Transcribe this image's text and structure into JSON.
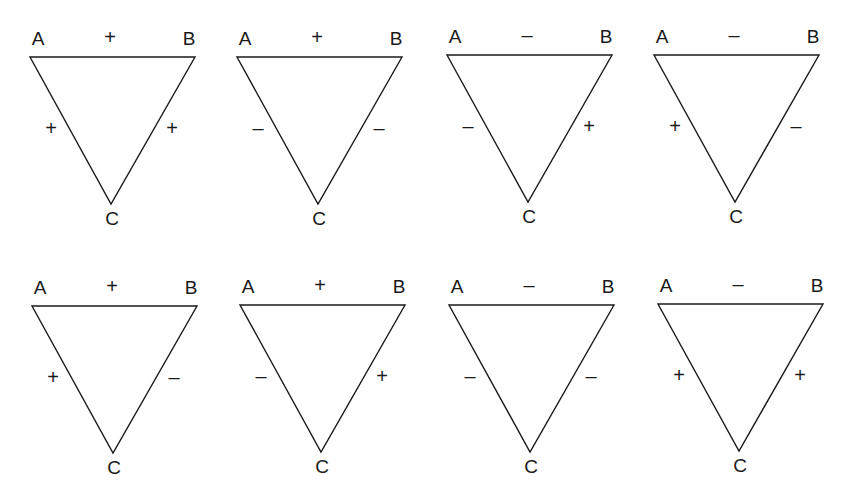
{
  "figure": {
    "vertex_labels": {
      "a": "A",
      "b": "B",
      "c": "C"
    },
    "line_color": "#1a1a1a",
    "triangles": [
      {
        "id": 1,
        "row": 0,
        "col": 0,
        "origin": [
          0,
          0
        ],
        "ab": "+",
        "ac": "+",
        "bc": "+"
      },
      {
        "id": 2,
        "row": 0,
        "col": 1,
        "origin": [
          207,
          0
        ],
        "ab": "+",
        "ac": "–",
        "bc": "–"
      },
      {
        "id": 3,
        "row": 0,
        "col": 2,
        "origin": [
          417,
          -2
        ],
        "ab": "–",
        "ac": "–",
        "bc": "+"
      },
      {
        "id": 4,
        "row": 0,
        "col": 3,
        "origin": [
          624,
          -2
        ],
        "ab": "–",
        "ac": "+",
        "bc": "–"
      },
      {
        "id": 5,
        "row": 1,
        "col": 0,
        "origin": [
          2,
          249
        ],
        "ab": "+",
        "ac": "+",
        "bc": "–"
      },
      {
        "id": 6,
        "row": 1,
        "col": 1,
        "origin": [
          210,
          248
        ],
        "ab": "+",
        "ac": "–",
        "bc": "+"
      },
      {
        "id": 7,
        "row": 1,
        "col": 2,
        "origin": [
          419,
          248
        ],
        "ab": "–",
        "ac": "–",
        "bc": "–"
      },
      {
        "id": 8,
        "row": 1,
        "col": 3,
        "origin": [
          628,
          247
        ],
        "ab": "–",
        "ac": "+",
        "bc": "+"
      }
    ]
  }
}
